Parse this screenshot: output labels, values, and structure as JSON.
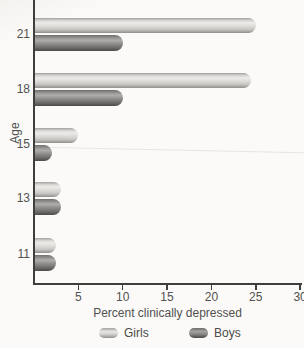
{
  "chart_data": {
    "type": "bar",
    "orientation": "horizontal",
    "title": "",
    "xlabel": "Percent clinically depressed",
    "ylabel": "Age",
    "categories": [
      "21",
      "18",
      "15",
      "13",
      "11"
    ],
    "series": [
      {
        "name": "Girls",
        "color": "#d9d8d5",
        "values": [
          25,
          24.5,
          5,
          3,
          2.5
        ]
      },
      {
        "name": "Boys",
        "color": "#6f6e6c",
        "values": [
          10,
          10,
          2,
          3,
          2.5
        ]
      }
    ],
    "xlim": [
      0,
      30
    ],
    "xticks": [
      5,
      10,
      15,
      20,
      25,
      30
    ],
    "grid": false,
    "legend_position": "bottom"
  },
  "colors": {
    "background": "#fbfaf8",
    "axis": "#3e3e3c",
    "text": "#515150",
    "girls_bar_mid": "#d9d8d5",
    "boys_bar_mid": "#8e8d8b"
  }
}
